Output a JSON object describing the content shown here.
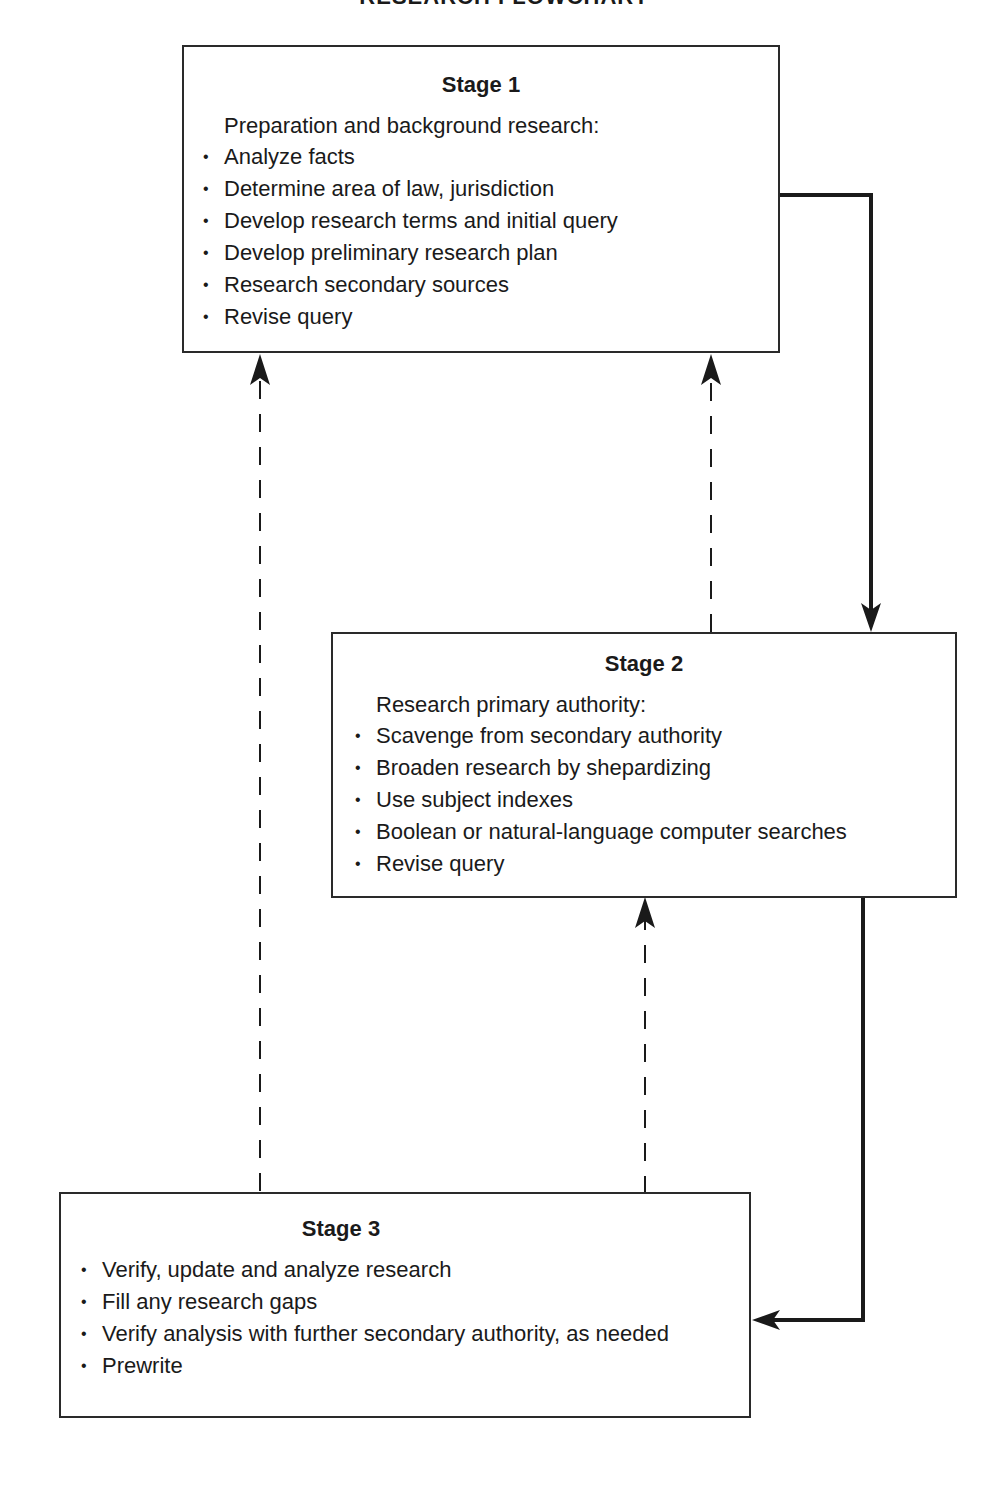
{
  "title": "RESEARCH FLOWCHART",
  "stages": [
    {
      "heading": "Stage 1",
      "intro": "Preparation and background research:",
      "items": [
        "Analyze facts",
        "Determine area of law, jurisdiction",
        "Develop research terms and initial query",
        "Develop preliminary research plan",
        "Research secondary sources",
        "Revise query"
      ]
    },
    {
      "heading": "Stage 2",
      "intro": "Research primary authority:",
      "items": [
        "Scavenge from secondary authority",
        "Broaden research by shepardizing",
        "Use subject indexes",
        "Boolean or natural-language computer searches",
        "Revise query"
      ]
    },
    {
      "heading": "Stage 3",
      "intro": "",
      "items": [
        "Verify, update and analyze research",
        "Fill any research gaps",
        "Verify analysis with further secondary authority, as needed",
        "Prewrite"
      ]
    }
  ],
  "bullet": "•",
  "connectors": [
    {
      "from": "Stage 1",
      "to": "Stage 2",
      "style": "solid"
    },
    {
      "from": "Stage 2",
      "to": "Stage 3",
      "style": "solid"
    },
    {
      "from": "Stage 2",
      "to": "Stage 1",
      "style": "dashed"
    },
    {
      "from": "Stage 3",
      "to": "Stage 1",
      "style": "dashed"
    },
    {
      "from": "Stage 3",
      "to": "Stage 2",
      "style": "dashed"
    }
  ],
  "colors": {
    "line": "#1a1a1a",
    "border": "#2a2a2a",
    "text": "#1a1a1a",
    "background": "#ffffff"
  }
}
